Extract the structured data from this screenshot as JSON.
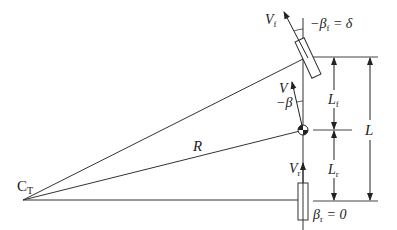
{
  "diagram": {
    "colors": {
      "line": "#333333",
      "background": "#ffffff"
    },
    "labels": {
      "center_turn": "C",
      "center_turn_sub": "T",
      "radius": "R",
      "front_velocity": "V",
      "front_velocity_sub": "f",
      "front_angle_prefix": "−β",
      "front_angle_sub": "f",
      "front_angle_suffix": " = δ",
      "cg_velocity": "V",
      "cg_angle": "−β",
      "rear_velocity": "V",
      "rear_velocity_sub": "r",
      "rear_angle_prefix": "β",
      "rear_angle_sub": "r",
      "rear_angle_suffix": " = 0",
      "front_length": "L",
      "front_length_sub": "f",
      "rear_length": "L",
      "rear_length_sub": "r",
      "wheelbase": "L"
    }
  }
}
